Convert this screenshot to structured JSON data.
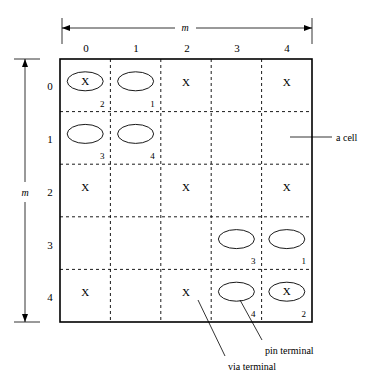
{
  "figure": {
    "grid_size": 5,
    "column_headers": [
      "0",
      "1",
      "2",
      "3",
      "4"
    ],
    "row_headers": [
      "0",
      "1",
      "2",
      "3",
      "4"
    ],
    "horizontal_dimension_label": "m",
    "vertical_dimension_label": "m",
    "blocked_marker": "X",
    "colors": {
      "line": "#000000",
      "background": "#ffffff",
      "cell_fill": "#ffffff"
    },
    "cells": [
      {
        "row": 0,
        "col": 0,
        "terminal": "pin",
        "number": "2",
        "blocked": "X"
      },
      {
        "row": 0,
        "col": 1,
        "terminal": "via",
        "number": "1",
        "blocked": ""
      },
      {
        "row": 0,
        "col": 2,
        "terminal": "",
        "number": "",
        "blocked": "X"
      },
      {
        "row": 0,
        "col": 3,
        "terminal": "",
        "number": "",
        "blocked": ""
      },
      {
        "row": 0,
        "col": 4,
        "terminal": "",
        "number": "",
        "blocked": "X"
      },
      {
        "row": 1,
        "col": 0,
        "terminal": "via",
        "number": "3",
        "blocked": ""
      },
      {
        "row": 1,
        "col": 1,
        "terminal": "via",
        "number": "4",
        "blocked": ""
      },
      {
        "row": 1,
        "col": 2,
        "terminal": "",
        "number": "",
        "blocked": ""
      },
      {
        "row": 1,
        "col": 3,
        "terminal": "",
        "number": "",
        "blocked": ""
      },
      {
        "row": 1,
        "col": 4,
        "terminal": "",
        "number": "",
        "blocked": ""
      },
      {
        "row": 2,
        "col": 0,
        "terminal": "",
        "number": "",
        "blocked": "X"
      },
      {
        "row": 2,
        "col": 1,
        "terminal": "",
        "number": "",
        "blocked": ""
      },
      {
        "row": 2,
        "col": 2,
        "terminal": "",
        "number": "",
        "blocked": "X"
      },
      {
        "row": 2,
        "col": 3,
        "terminal": "",
        "number": "",
        "blocked": ""
      },
      {
        "row": 2,
        "col": 4,
        "terminal": "",
        "number": "",
        "blocked": "X"
      },
      {
        "row": 3,
        "col": 0,
        "terminal": "",
        "number": "",
        "blocked": ""
      },
      {
        "row": 3,
        "col": 1,
        "terminal": "",
        "number": "",
        "blocked": ""
      },
      {
        "row": 3,
        "col": 2,
        "terminal": "",
        "number": "",
        "blocked": ""
      },
      {
        "row": 3,
        "col": 3,
        "terminal": "via",
        "number": "3",
        "blocked": ""
      },
      {
        "row": 3,
        "col": 4,
        "terminal": "via",
        "number": "1",
        "blocked": ""
      },
      {
        "row": 4,
        "col": 0,
        "terminal": "",
        "number": "",
        "blocked": "X"
      },
      {
        "row": 4,
        "col": 1,
        "terminal": "",
        "number": "",
        "blocked": ""
      },
      {
        "row": 4,
        "col": 2,
        "terminal": "",
        "number": "",
        "blocked": "X"
      },
      {
        "row": 4,
        "col": 3,
        "terminal": "via",
        "number": "4",
        "blocked": ""
      },
      {
        "row": 4,
        "col": 4,
        "terminal": "pin",
        "number": "2",
        "blocked": "X"
      }
    ],
    "annotations": [
      {
        "id": "a-cell",
        "label": "a cell"
      },
      {
        "id": "via-terminal",
        "label": "via terminal"
      },
      {
        "id": "pin-terminal",
        "label": "pin terminal"
      }
    ]
  }
}
